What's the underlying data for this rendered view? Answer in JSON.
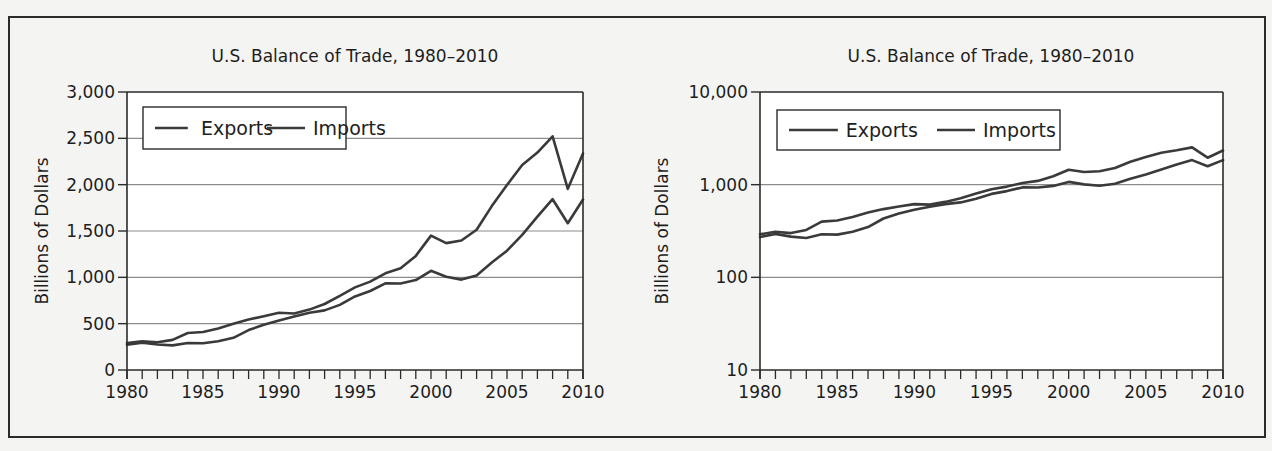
{
  "chart_data": [
    {
      "type": "line",
      "title": "U.S. Balance of Trade, 1980–2010",
      "xlabel": "",
      "ylabel": "Billions of Dollars",
      "yscale": "linear",
      "ylim": [
        0,
        3000
      ],
      "yticks": [
        0,
        500,
        1000,
        1500,
        2000,
        2500,
        3000
      ],
      "ytick_labels": [
        "0",
        "500",
        "1,000",
        "1,500",
        "2,000",
        "2,500",
        "3,000"
      ],
      "xlim": [
        1980,
        2010
      ],
      "xticks": [
        1980,
        1985,
        1990,
        1995,
        2000,
        2005,
        2010
      ],
      "xtick_labels": [
        "1980",
        "1985",
        "1990",
        "1995",
        "2000",
        "2005",
        "2010"
      ],
      "grid": "horizontal",
      "legend_position": "upper left",
      "legend": [
        "Exports",
        "Imports"
      ],
      "x": [
        1980,
        1981,
        1982,
        1983,
        1984,
        1985,
        1986,
        1987,
        1988,
        1989,
        1990,
        1991,
        1992,
        1993,
        1994,
        1995,
        1996,
        1997,
        1998,
        1999,
        2000,
        2001,
        2002,
        2003,
        2004,
        2005,
        2006,
        2007,
        2008,
        2009,
        2010
      ],
      "series": [
        {
          "name": "Exports",
          "values": [
            272,
            294,
            275,
            266,
            291,
            289,
            310,
            348,
            431,
            488,
            535,
            578,
            617,
            643,
            703,
            794,
            852,
            935,
            933,
            970,
            1071,
            1007,
            975,
            1021,
            1160,
            1287,
            1458,
            1654,
            1843,
            1584,
            1840
          ]
        },
        {
          "name": "Imports",
          "values": [
            291,
            310,
            300,
            325,
            399,
            410,
            448,
            500,
            545,
            581,
            617,
            610,
            652,
            712,
            800,
            891,
            954,
            1043,
            1099,
            1231,
            1450,
            1369,
            1398,
            1514,
            1769,
            1996,
            2212,
            2346,
            2522,
            1955,
            2337
          ]
        }
      ]
    },
    {
      "type": "line",
      "title": "U.S. Balance of Trade, 1980–2010",
      "xlabel": "",
      "ylabel": "Billions of Dollars",
      "yscale": "log",
      "ylim": [
        10,
        10000
      ],
      "yticks": [
        10,
        100,
        1000,
        10000
      ],
      "ytick_labels": [
        "10",
        "100",
        "1,000",
        "10,000"
      ],
      "xlim": [
        1980,
        2010
      ],
      "xticks": [
        1980,
        1985,
        1990,
        1995,
        2000,
        2005,
        2010
      ],
      "xtick_labels": [
        "1980",
        "1985",
        "1990",
        "1995",
        "2000",
        "2005",
        "2010"
      ],
      "grid": "horizontal",
      "legend_position": "upper left",
      "legend": [
        "Exports",
        "Imports"
      ],
      "x": [
        1980,
        1981,
        1982,
        1983,
        1984,
        1985,
        1986,
        1987,
        1988,
        1989,
        1990,
        1991,
        1992,
        1993,
        1994,
        1995,
        1996,
        1997,
        1998,
        1999,
        2000,
        2001,
        2002,
        2003,
        2004,
        2005,
        2006,
        2007,
        2008,
        2009,
        2010
      ],
      "series": [
        {
          "name": "Exports",
          "values": [
            272,
            294,
            275,
            266,
            291,
            289,
            310,
            348,
            431,
            488,
            535,
            578,
            617,
            643,
            703,
            794,
            852,
            935,
            933,
            970,
            1071,
            1007,
            975,
            1021,
            1160,
            1287,
            1458,
            1654,
            1843,
            1584,
            1840
          ]
        },
        {
          "name": "Imports",
          "values": [
            291,
            310,
            300,
            325,
            399,
            410,
            448,
            500,
            545,
            581,
            617,
            610,
            652,
            712,
            800,
            891,
            954,
            1043,
            1099,
            1231,
            1450,
            1369,
            1398,
            1514,
            1769,
            1996,
            2212,
            2346,
            2522,
            1955,
            2337
          ]
        }
      ]
    }
  ],
  "colors": {
    "line": "#3a3a3a",
    "grid": "#8c8c8c",
    "axis": "#2b2b2b",
    "plot_bg": "#ffffff"
  }
}
